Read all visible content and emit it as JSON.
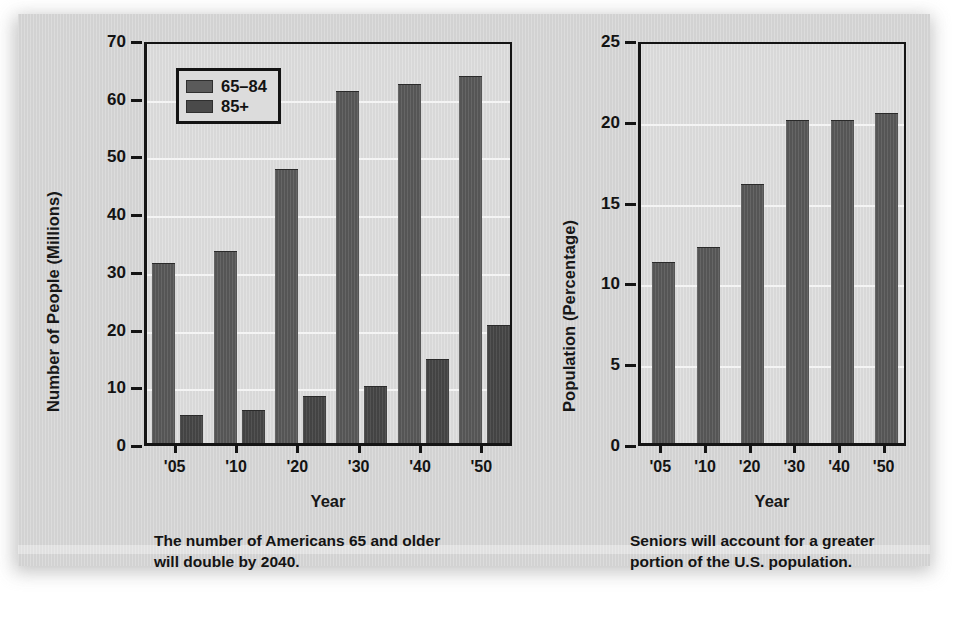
{
  "figure": {
    "panel_background": "#d2d2d2",
    "bar_color_65_84": "#5a5a5a",
    "bar_color_85_plus": "#4a4a4a"
  },
  "left": {
    "caption": "The number of Americans 65 and older\nwill double by 2040.",
    "legend": [
      {
        "label": "65–84",
        "swatch": "#5a5a5a"
      },
      {
        "label": "85+",
        "swatch": "#4a4a4a"
      }
    ]
  },
  "right": {
    "caption": "Seniors will account for a greater\nportion of the U.S. population."
  },
  "chart_data": [
    {
      "type": "bar",
      "id": "number-of-people",
      "title": "",
      "xlabel": "Year",
      "ylabel": "Number of People (Millions)",
      "categories": [
        "'05",
        "'10",
        "'20",
        "'30",
        "'40",
        "'50"
      ],
      "ylim": [
        0,
        70
      ],
      "yticks": [
        0,
        10,
        20,
        30,
        40,
        50,
        60,
        70
      ],
      "yticklabels": [
        "0",
        "10",
        "20",
        "30",
        "40",
        "50",
        "60",
        "70"
      ],
      "grid": true,
      "legend_position": "upper-left",
      "series": [
        {
          "name": "65–84",
          "values": [
            31.2,
            33.2,
            47.5,
            61.0,
            62.2,
            63.6
          ]
        },
        {
          "name": "85+",
          "values": [
            4.9,
            5.8,
            8.2,
            9.9,
            14.6,
            20.4
          ]
        }
      ]
    },
    {
      "type": "bar",
      "id": "population-percentage",
      "title": "",
      "xlabel": "Year",
      "ylabel": "Population (Percentage)",
      "categories": [
        "'05",
        "'10",
        "'20",
        "'30",
        "'40",
        "'50"
      ],
      "ylim": [
        0,
        25
      ],
      "yticks": [
        0,
        5,
        10,
        15,
        20,
        25
      ],
      "yticklabels": [
        "0",
        "5",
        "10",
        "15",
        "20",
        "25"
      ],
      "grid": true,
      "legend_position": "none",
      "series": [
        {
          "name": "Seniors",
          "values": [
            11.2,
            12.1,
            16.0,
            20.0,
            20.0,
            20.4
          ]
        }
      ]
    }
  ]
}
